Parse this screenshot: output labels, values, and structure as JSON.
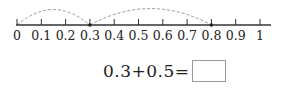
{
  "number_line": {
    "min": 0,
    "max": 1,
    "step": 0.1,
    "tick_labels": [
      "0",
      "0.1",
      "0.2",
      "0.3",
      "0.4",
      "0.5",
      "0.6",
      "0.7",
      "0.8",
      "0.9",
      "1"
    ],
    "jumps": [
      {
        "from": 0,
        "to": 0.3
      },
      {
        "from": 0.3,
        "to": 0.8
      }
    ],
    "marked_points": [
      0.3,
      0.8
    ],
    "line_color": "#333333",
    "arc_color": "#999999"
  },
  "equation": {
    "expression": "0.3+0.5=",
    "answer": ""
  }
}
